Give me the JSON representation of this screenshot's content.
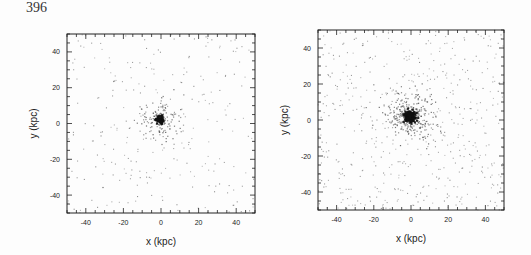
{
  "page": {
    "number": "396"
  },
  "colors": {
    "frame": "#222222",
    "point": "#555555",
    "core": "#111111",
    "background": "#fdfdfd"
  },
  "chart_data": [
    {
      "type": "scatter",
      "id": "left",
      "title": "",
      "xlabel": "x (kpc)",
      "ylabel": "y (kpc)",
      "xlim": [
        -50,
        50
      ],
      "ylim": [
        -50,
        50
      ],
      "xticks": [
        -40,
        -20,
        0,
        20,
        40
      ],
      "yticks": [
        -40,
        -20,
        0,
        20,
        40
      ],
      "minor_tick_step": 5,
      "grid": false,
      "legend": null,
      "frame_px": {
        "left": 67,
        "top": 34,
        "width": 188,
        "height": 179
      },
      "distribution": {
        "center": [
          -0.5,
          2
        ],
        "core_radius_kpc": 2,
        "core_points": 120,
        "inner_radius_kpc": 12,
        "inner_points": 180,
        "halo_points": 260,
        "seed": 396
      }
    },
    {
      "type": "scatter",
      "id": "right",
      "title": "",
      "xlabel": "x (kpc)",
      "ylabel": "y (kpc)",
      "xlim": [
        -50,
        50
      ],
      "ylim": [
        -50,
        50
      ],
      "xticks": [
        -40,
        -20,
        0,
        20,
        40
      ],
      "yticks": [
        -40,
        -20,
        0,
        20,
        40
      ],
      "minor_tick_step": 5,
      "grid": false,
      "legend": null,
      "frame_px": {
        "left": 318,
        "top": 30,
        "width": 186,
        "height": 180
      },
      "distribution": {
        "center": [
          -0.5,
          2
        ],
        "core_radius_kpc": 3,
        "core_points": 260,
        "inner_radius_kpc": 14,
        "inner_points": 420,
        "halo_points": 520,
        "seed": 7
      }
    }
  ]
}
